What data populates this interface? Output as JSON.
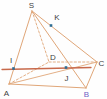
{
  "diagram": {
    "type": "geometry-figure",
    "description_labels": [
      "S",
      "K",
      "I",
      "D",
      "C",
      "A",
      "J",
      "B"
    ],
    "colors": {
      "background": "#fefefe",
      "edge": "#e0a678",
      "secant": "#c86a4c",
      "dot": "#2f6e94",
      "label": "#3f3f3f",
      "labelB": "#6e61c5"
    },
    "points": {
      "S": {
        "x": 32,
        "y": 11,
        "label": "S",
        "lx": 31.5,
        "ly": 7.5,
        "lcolor": "label"
      },
      "A": {
        "x": 9,
        "y": 84,
        "label": "A",
        "lx": 6.5,
        "ly": 95.5,
        "lcolor": "label"
      },
      "B": {
        "x": 86,
        "y": 88,
        "label": "B",
        "lx": 86.5,
        "ly": 97,
        "lcolor": "labelB"
      },
      "C": {
        "x": 97,
        "y": 62,
        "label": "C",
        "lx": 101.5,
        "ly": 65.5,
        "lcolor": "label"
      },
      "D": {
        "x": 49,
        "y": 62,
        "label": "D",
        "lx": 53,
        "ly": 60,
        "lcolor": "label"
      },
      "K": {
        "x": 51,
        "y": 25.5,
        "label": "K",
        "lx": 57,
        "ly": 20,
        "lcolor": "label"
      },
      "I": {
        "x": 13.5,
        "y": 68.5,
        "label": "I",
        "lx": 11,
        "ly": 62.5,
        "lcolor": "label"
      },
      "J": {
        "x": 66,
        "y": 67.5,
        "label": "J",
        "lx": 66.5,
        "ly": 80.5,
        "lcolor": "label"
      }
    },
    "edges": [
      {
        "from": "S",
        "to": "A",
        "style": "solid",
        "color": "edge",
        "width": 1
      },
      {
        "from": "S",
        "to": "B",
        "style": "solid",
        "color": "edge",
        "width": 1
      },
      {
        "from": "S",
        "to": "C",
        "style": "solid",
        "color": "edge",
        "width": 1
      },
      {
        "from": "S",
        "to": "D",
        "style": "dashed",
        "color": "edge",
        "width": 0.9
      },
      {
        "from": "A",
        "to": "B",
        "style": "solid",
        "color": "edge",
        "width": 1
      },
      {
        "from": "B",
        "to": "C",
        "style": "solid",
        "color": "edge",
        "width": 1
      },
      {
        "from": "A",
        "to": "D",
        "style": "dashed",
        "color": "edge",
        "width": 0.9
      },
      {
        "from": "D",
        "to": "C",
        "style": "dashed",
        "color": "edge",
        "width": 0.9
      },
      {
        "from": "A",
        "to": "C",
        "style": "solid",
        "color": "edge",
        "width": 0.9
      }
    ],
    "secant_line": {
      "x1": 2,
      "y1": 69.5,
      "x2": 91,
      "y2": 67.5,
      "width": 1.3
    },
    "marked_points": [
      "K",
      "I",
      "J"
    ],
    "dot_size": 2.6
  }
}
